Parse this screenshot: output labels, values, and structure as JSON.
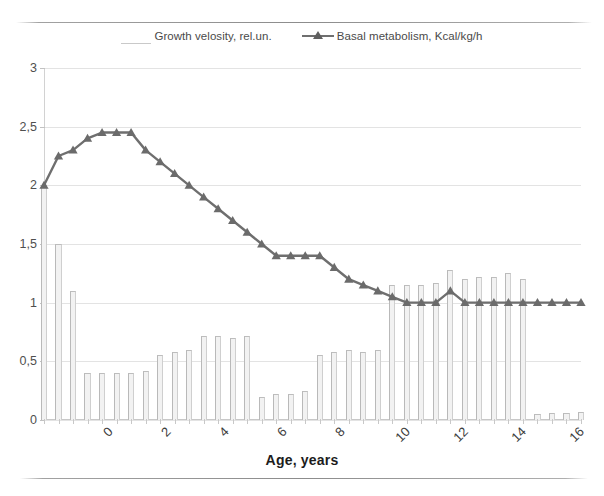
{
  "legend": {
    "items": [
      {
        "label": "Growth velosity, rel.un.",
        "marker": "bar-swatch",
        "color": "#f2f2f2"
      },
      {
        "label": "Basal metabolism, Kcal/kg/h",
        "marker": "line-triangle-swatch",
        "color": "#6f6f6f"
      }
    ]
  },
  "axes": {
    "y_labels": [
      "0",
      "0,5",
      "1",
      "1,5",
      "2",
      "2,5",
      "3"
    ],
    "x_labels": [
      "0",
      "2",
      "4",
      "6",
      "8",
      "10",
      "12",
      "14",
      "16",
      "18"
    ],
    "x_title": "Age, years"
  },
  "chart_data": {
    "type": "bar",
    "title": "",
    "subtitle": "",
    "xlabel": "Age, years",
    "ylabel": "",
    "xlim": [
      0,
      18.5
    ],
    "ylim": [
      0,
      3
    ],
    "yticks": [
      0,
      0.5,
      1,
      1.5,
      2,
      2.5,
      3
    ],
    "xticks": [
      0,
      2,
      4,
      6,
      8,
      10,
      12,
      14,
      16,
      18
    ],
    "grid": true,
    "legend_position": "top-center",
    "x": [
      0,
      0.5,
      1,
      1.5,
      2,
      2.5,
      3,
      3.5,
      4,
      4.5,
      5,
      5.5,
      6,
      6.5,
      7,
      7.5,
      8,
      8.5,
      9,
      9.5,
      10,
      10.5,
      11,
      11.5,
      12,
      12.5,
      13,
      13.5,
      14,
      14.5,
      15,
      15.5,
      16,
      16.5,
      17,
      17.5,
      18,
      18.5
    ],
    "series": [
      {
        "name": "Growth velosity, rel.un.",
        "type": "bar",
        "color": "#f2f2f2",
        "values": [
          2.0,
          1.5,
          1.1,
          0.4,
          0.4,
          0.4,
          0.4,
          0.42,
          0.55,
          0.58,
          0.6,
          0.72,
          0.72,
          0.7,
          0.72,
          0.2,
          0.22,
          0.22,
          0.25,
          0.55,
          0.58,
          0.6,
          0.58,
          0.6,
          1.15,
          1.15,
          1.15,
          1.17,
          1.28,
          1.2,
          1.22,
          1.22,
          1.25,
          1.2,
          0.05,
          0.06,
          0.06,
          0.07
        ]
      },
      {
        "name": "Basal metabolism, Kcal/kg/h",
        "type": "line",
        "color": "#6f6f6f",
        "marker": "triangle",
        "values": [
          2.0,
          2.25,
          2.3,
          2.4,
          2.45,
          2.45,
          2.45,
          2.3,
          2.2,
          2.1,
          2.0,
          1.9,
          1.8,
          1.7,
          1.6,
          1.5,
          1.4,
          1.4,
          1.4,
          1.4,
          1.3,
          1.2,
          1.15,
          1.1,
          1.05,
          1.0,
          1.0,
          1.0,
          1.1,
          1.0,
          1.0,
          1.0,
          1.0,
          1.0,
          1.0,
          1.0,
          1.0,
          1.0
        ]
      }
    ]
  }
}
